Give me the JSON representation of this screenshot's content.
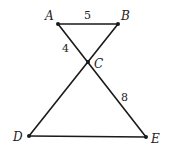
{
  "diagram": {
    "type": "geometry",
    "points": [
      {
        "id": "A",
        "label": "A",
        "x": 58,
        "y": 24,
        "lx": 45,
        "ly": 20
      },
      {
        "id": "B",
        "label": "B",
        "x": 118,
        "y": 24,
        "lx": 121,
        "ly": 20
      },
      {
        "id": "C",
        "label": "C",
        "x": 88,
        "y": 62,
        "lx": 94,
        "ly": 68
      },
      {
        "id": "D",
        "label": "D",
        "x": 29,
        "y": 136,
        "lx": 13,
        "ly": 141
      },
      {
        "id": "E",
        "label": "E",
        "x": 146,
        "y": 137,
        "lx": 151,
        "ly": 143
      }
    ],
    "segments": [
      {
        "from": "A",
        "to": "B"
      },
      {
        "from": "A",
        "to": "E"
      },
      {
        "from": "B",
        "to": "D"
      },
      {
        "from": "D",
        "to": "E"
      }
    ],
    "measures": [
      {
        "segment": "AB",
        "value": "5",
        "x": 84,
        "y": 19
      },
      {
        "segment": "AC",
        "value": "4",
        "x": 62,
        "y": 52
      },
      {
        "segment": "CE",
        "value": "8",
        "x": 121,
        "y": 101
      }
    ]
  }
}
